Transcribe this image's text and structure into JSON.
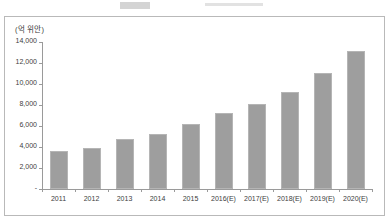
{
  "chart_data": {
    "type": "bar",
    "title": "",
    "subtitle": "",
    "unit_label": "(억 위안)",
    "xlabel": "",
    "ylabel": "",
    "categories": [
      "2011",
      "2012",
      "2013",
      "2014",
      "2015",
      "2016(E)",
      "2017(E)",
      "2018(E)",
      "2019(E)",
      "2020(E)"
    ],
    "values": [
      3600,
      3950,
      4750,
      5200,
      6200,
      7200,
      8100,
      9200,
      11000,
      13100
    ],
    "ylim": [
      0,
      14000
    ],
    "ytick_labels": [
      "14,000",
      "12,000",
      "10,000",
      "8,000",
      "6,000",
      "4,000",
      "2,000",
      "-"
    ],
    "ytick_values": [
      14000,
      12000,
      10000,
      8000,
      6000,
      4000,
      2000,
      0
    ],
    "grid": false,
    "legend": [],
    "legend_position": "none",
    "bar_color": "#9e9e9e",
    "axis_color": "#9a9a9a",
    "text_color": "#3d3d3d",
    "frame_color": "#b9b9b9"
  }
}
